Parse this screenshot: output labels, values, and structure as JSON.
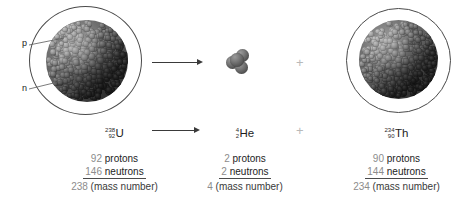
{
  "diagram": {
    "labels": {
      "proton": "p",
      "neutron": "n"
    },
    "operators": {
      "plus_top": "+",
      "plus_bottom": "+",
      "arrow_top": "→",
      "arrow_bottom": "→"
    },
    "colors": {
      "number_gray": "#8c8c8c",
      "text_dark": "#1d1d1d",
      "nucleus_gray": "#636363",
      "shell_stroke": "#4a4a4a",
      "plus_gray": "#b9b9b9"
    },
    "species": [
      {
        "id": "uranium-238",
        "mass_number": "238",
        "atomic_number": "92",
        "symbol": "U",
        "protons_value": "92",
        "protons_word": "protons",
        "neutrons_value": "146",
        "neutrons_word": "neutrons",
        "mass_value": "238",
        "mass_word": "(mass number)"
      },
      {
        "id": "helium-4",
        "mass_number": "4",
        "atomic_number": "2",
        "symbol": "He",
        "protons_value": "2",
        "protons_word": "protons",
        "neutrons_value": "2",
        "neutrons_word": "neutrons",
        "mass_value": "4",
        "mass_word": "(mass number)"
      },
      {
        "id": "thorium-234",
        "mass_number": "234",
        "atomic_number": "90",
        "symbol": "Th",
        "protons_value": "90",
        "protons_word": "protons",
        "neutrons_value": "144",
        "neutrons_word": "neutrons",
        "mass_value": "234",
        "mass_word": "(mass number)"
      }
    ]
  }
}
